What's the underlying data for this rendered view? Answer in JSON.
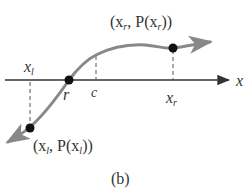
{
  "diagram": {
    "caption": "(b)",
    "axis_label": "x",
    "curve_color": "#888888",
    "axis_color": "#333333",
    "points": {
      "root": {
        "label": "r"
      },
      "midpoint": {
        "label": "c"
      },
      "left": {
        "tick_label": "x",
        "tick_sub": "l",
        "coord_label": {
          "open": "(x",
          "sub1": "l",
          "mid": ", P(x",
          "sub2": "l",
          "close": "))"
        }
      },
      "right": {
        "tick_label": "x",
        "tick_sub": "r",
        "coord_label": {
          "open": "(x",
          "sub1": "r",
          "mid": ", P(x",
          "sub2": "r",
          "close": "))"
        }
      }
    }
  }
}
